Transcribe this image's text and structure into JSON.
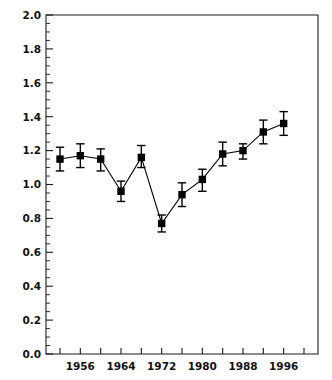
{
  "chart_data": {
    "type": "line",
    "title": "",
    "subtitle": "",
    "xlabel": "",
    "ylabel": "",
    "xlim": [
      1950,
      1998
    ],
    "ylim": [
      0.0,
      2.0
    ],
    "grid": false,
    "legend": null,
    "x_tick_labels": [
      "1956",
      "1964",
      "1972",
      "1980",
      "1988",
      "1996"
    ],
    "x_tick_values": [
      1952,
      1956,
      1960,
      1964,
      1968,
      1972,
      1976,
      1980,
      1984,
      1988,
      1992,
      1996,
      2000
    ],
    "x_tick_labeled": [
      false,
      true,
      false,
      true,
      false,
      true,
      false,
      true,
      false,
      true,
      false,
      true,
      false
    ],
    "y_tick_labels": [
      "0.0",
      "0.2",
      "0.4",
      "0.6",
      "0.8",
      "1.0",
      "1.2",
      "1.4",
      "1.6",
      "1.8",
      "2.0"
    ],
    "y_tick_values": [
      0.0,
      0.2,
      0.4,
      0.6,
      0.8,
      1.0,
      1.2,
      1.4,
      1.6,
      1.8,
      2.0
    ],
    "y_minor_step": 0.05,
    "marker_style": "filled-square",
    "marker_color": "#000000",
    "line_color": "#000000",
    "errorbar_color": "#000000",
    "series": [
      {
        "name": "series-1",
        "x": [
          1952,
          1956,
          1960,
          1964,
          1968,
          1972,
          1976,
          1980,
          1984,
          1988,
          1992,
          1996
        ],
        "values": [
          1.15,
          1.17,
          1.15,
          0.96,
          1.16,
          0.77,
          0.94,
          1.03,
          1.18,
          1.2,
          1.31,
          1.36
        ],
        "err_low": [
          0.07,
          0.07,
          0.07,
          0.06,
          0.06,
          0.05,
          0.07,
          0.07,
          0.07,
          0.05,
          0.07,
          0.07
        ],
        "err_high": [
          0.07,
          0.07,
          0.06,
          0.06,
          0.07,
          0.05,
          0.07,
          0.06,
          0.07,
          0.04,
          0.07,
          0.07
        ]
      }
    ]
  },
  "plot": {
    "background_color": "#ffffff",
    "axis_color": "#1a1a1a"
  }
}
